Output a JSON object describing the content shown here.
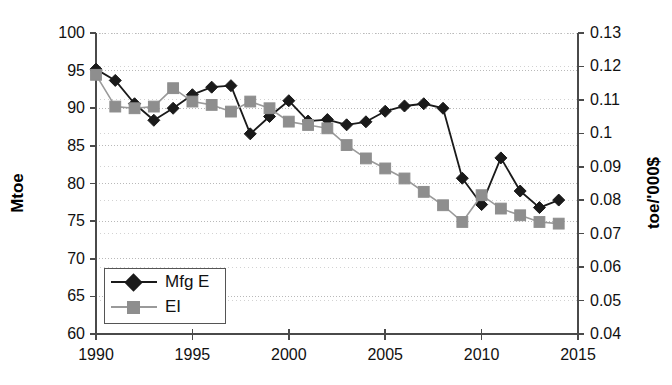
{
  "chart_data": {
    "type": "line",
    "title": "",
    "xlabel": "",
    "ylabel": "Mtoe",
    "y2label": "toe/'000$",
    "grid": true,
    "legend_position": "bottom-left",
    "xlim": [
      1990,
      2015
    ],
    "xticks": [
      1990,
      1995,
      2000,
      2005,
      2010,
      2015
    ],
    "ylim": [
      60,
      100
    ],
    "yticks": [
      60,
      65,
      70,
      75,
      80,
      85,
      90,
      95,
      100
    ],
    "y2lim": [
      0.04,
      0.13
    ],
    "y2ticks": [
      0.04,
      0.05,
      0.06,
      0.07,
      0.08,
      0.09,
      0.1,
      0.11,
      0.12,
      0.13
    ],
    "ytick_labels": [
      "60",
      "65",
      "70",
      "75",
      "80",
      "85",
      "90",
      "95",
      "100"
    ],
    "y2tick_labels": [
      "0.04",
      "0.05",
      "0.06",
      "0.07",
      "0.08",
      "0.09",
      "0.1",
      "0.11",
      "0.12",
      "0.13"
    ],
    "xtick_labels": [
      "1990",
      "1995",
      "2000",
      "2005",
      "2010",
      "2015"
    ],
    "x": [
      1990,
      1991,
      1992,
      1993,
      1994,
      1995,
      1996,
      1997,
      1998,
      1999,
      2000,
      2001,
      2002,
      2003,
      2004,
      2005,
      2006,
      2007,
      2008,
      2009,
      2010,
      2011,
      2012,
      2013,
      2014
    ],
    "series": [
      {
        "name": "Mfg E",
        "axis": "left",
        "color": "#1a1a1a",
        "marker": "diamond",
        "values": [
          95.2,
          93.7,
          90.6,
          88.4,
          90.0,
          91.8,
          92.8,
          93.0,
          86.6,
          88.9,
          91.0,
          88.3,
          88.5,
          87.8,
          88.2,
          89.6,
          90.3,
          90.6,
          90.0,
          80.7,
          77.2,
          83.4,
          79.0,
          76.8,
          77.8
        ]
      },
      {
        "name": "EI",
        "axis": "right",
        "color": "#8e8e8e",
        "marker": "square",
        "values": [
          0.1175,
          0.108,
          0.1075,
          0.108,
          0.1135,
          0.1095,
          0.1085,
          0.1065,
          0.1095,
          0.1075,
          0.1035,
          0.1025,
          0.1015,
          0.0965,
          0.0925,
          0.0895,
          0.0865,
          0.0825,
          0.0785,
          0.0735,
          0.0815,
          0.0775,
          0.0755,
          0.0735,
          0.073
        ]
      }
    ]
  },
  "legend": {
    "items": [
      {
        "label": "Mfg E"
      },
      {
        "label": "EI"
      }
    ]
  },
  "axes": {
    "left_title": "Mtoe",
    "right_title": "toe/'000$"
  }
}
